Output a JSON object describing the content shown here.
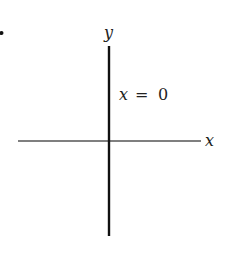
{
  "diagram": {
    "bullet": "•",
    "x_axis_label": "x",
    "y_axis_label": "y",
    "line_label": "x = 0",
    "line_label_var": "x",
    "line_label_eq": "=",
    "line_label_val": "0",
    "colors": {
      "x_axis": "#555555",
      "y_line": "#111111",
      "text": "#222222"
    }
  }
}
